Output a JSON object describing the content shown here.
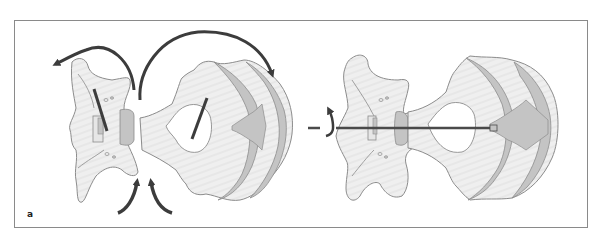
{
  "figure": {
    "panel_label": "a",
    "colors": {
      "frame": "#8a8a8a",
      "bone_fill": "#efefef",
      "bone_outline": "#8c8c8c",
      "cartilage_fill": "#c4c4c4",
      "arrow": "#3c3c3c",
      "axis_line": "#4a4a4a"
    },
    "left_group": {
      "parts": [
        "posterior-element",
        "vertebral-body"
      ],
      "arrows": [
        "rotation-arrow-left",
        "rotation-arrow-right",
        "push-arrow-left",
        "push-arrow-right"
      ]
    },
    "right_group": {
      "parts": [
        "posterior-element",
        "vertebral-body"
      ],
      "arrows": [
        "axis-rotation-arrow"
      ],
      "axis": "horizontal-axis-line"
    }
  }
}
